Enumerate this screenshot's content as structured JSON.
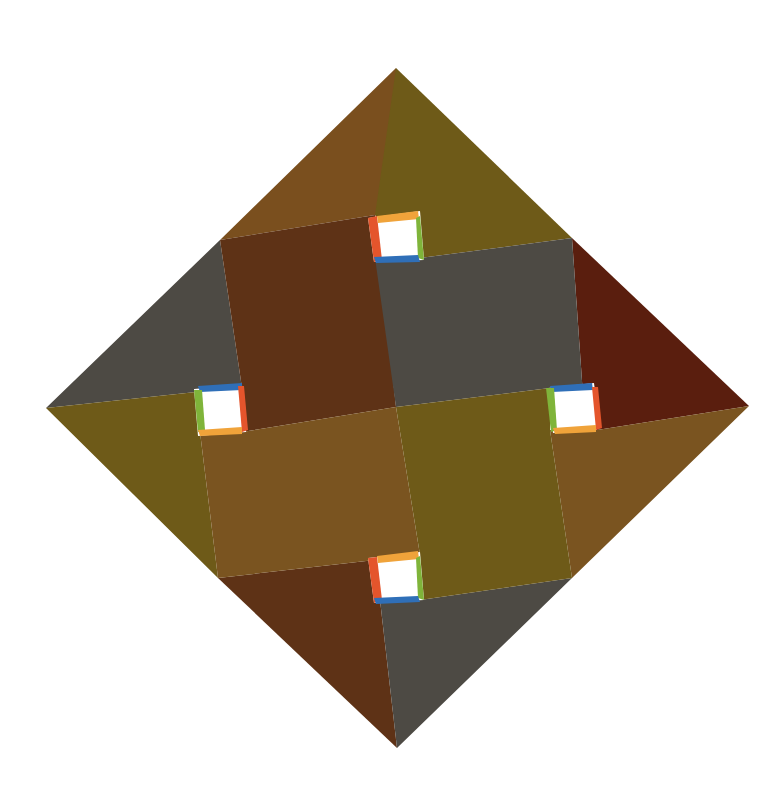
{
  "artwork": {
    "title": "Geometric diamond composition",
    "colors": {
      "background": "#ffffff",
      "brown_light": "#7a4f1e",
      "brown_dark": "#5e3216",
      "olive": "#6e5a18",
      "olive_light": "#7a6420",
      "gray": "#4d4a44",
      "maroon": "#5a1e0e",
      "ochre": "#7a5420",
      "white_gap": "#ffffff",
      "accent_red": "#e4552c",
      "accent_orange": "#f0a33a",
      "accent_green": "#7fb43a",
      "accent_blue": "#2f6fb8"
    }
  }
}
